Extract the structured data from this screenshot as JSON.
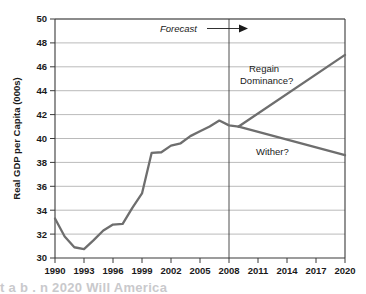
{
  "figure": {
    "background_color": "#ffffff",
    "line_color": "#6e6e6e",
    "axis_color": "#3a3a3a",
    "grid_color": "#8c8c8c",
    "caption_partial": "t a b  .  n  2020 Will America"
  },
  "chart_data": {
    "type": "line",
    "title": "",
    "xlabel": "",
    "ylabel": "Real GDP per Capita  (000s)",
    "xlim": [
      1990,
      2020
    ],
    "ylim": [
      30,
      50
    ],
    "grid": true,
    "legend": false,
    "xticks": [
      1990,
      1993,
      1996,
      1999,
      2002,
      2005,
      2008,
      2011,
      2014,
      2017,
      2020
    ],
    "xtick_labels": [
      "1990",
      "1993",
      "1996",
      "1999",
      "2002",
      "2005",
      "2008",
      "2011",
      "2014",
      "2017",
      "2020"
    ],
    "yticks": [
      30,
      32,
      34,
      36,
      38,
      40,
      42,
      44,
      46,
      48,
      50
    ],
    "ytick_labels": [
      "30",
      "32",
      "34",
      "36",
      "38",
      "40",
      "42",
      "44",
      "46",
      "48",
      "50"
    ],
    "series": [
      {
        "name": "Historical Real GDP per Capita",
        "kind": "historical",
        "x": [
          1990,
          1991,
          1992,
          1993,
          1994,
          1995,
          1996,
          1997,
          1998,
          1999,
          2000,
          2001,
          2002,
          2003,
          2004,
          2005,
          2006,
          2007,
          2008,
          2009
        ],
        "values": [
          33.3,
          31.8,
          30.9,
          30.75,
          31.5,
          32.3,
          32.8,
          32.85,
          34.2,
          35.4,
          38.8,
          38.85,
          39.4,
          39.6,
          40.2,
          40.6,
          41.0,
          41.5,
          41.1,
          41.0
        ]
      },
      {
        "name": "Regain Dominance?",
        "kind": "forecast-high",
        "x": [
          2009,
          2020
        ],
        "values": [
          41.0,
          47.0
        ]
      },
      {
        "name": "Wither?",
        "kind": "forecast-low",
        "x": [
          2009,
          2020
        ],
        "values": [
          41.0,
          38.6
        ]
      }
    ],
    "annotations": [
      {
        "id": "forecast",
        "text": "Forecast",
        "style": "italic",
        "has_arrow": true,
        "x": 2006.2,
        "y": 48.9
      },
      {
        "id": "regain-dominance",
        "text_lines": [
          "Regain",
          "Dominance?"
        ],
        "x": 2011.1,
        "y": 46.3
      },
      {
        "id": "wither",
        "text_lines": [
          "Wither?"
        ],
        "x": 2012.6,
        "y": 39.6
      }
    ],
    "vlines": [
      {
        "id": "forecast-divider",
        "x": 2008,
        "label": "Forecast boundary"
      }
    ]
  }
}
